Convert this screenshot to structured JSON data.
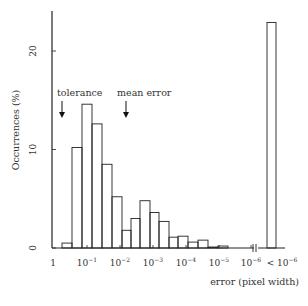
{
  "chart_data": {
    "type": "bar",
    "title": "",
    "xlabel": "error (pixel width)",
    "ylabel": "Occurrences (%)",
    "ylim": [
      0,
      24
    ],
    "yticks": [
      0,
      10,
      20
    ],
    "xtick_labels": [
      "1",
      "10^-1",
      "10^-2",
      "10^-3",
      "10^-4",
      "10^-5",
      "10^-6",
      "< 10^-6"
    ],
    "grid": false,
    "legend": null,
    "annotations": [
      {
        "text": "tolerance",
        "arrow": "down",
        "x_pos": "between 1 and 10^-1 (~10^-0.5)"
      },
      {
        "text": "mean error",
        "arrow": "down",
        "x_pos": "~10^-2.1"
      }
    ],
    "bins": [
      {
        "from": "10^0",
        "to": "10^-0.33",
        "value": 0.5
      },
      {
        "from": "10^-0.33",
        "to": "10^-0.67",
        "value": 10.2
      },
      {
        "from": "10^-0.67",
        "to": "10^-1",
        "value": 14.6
      },
      {
        "from": "10^-1",
        "to": "10^-1.33",
        "value": 12.6
      },
      {
        "from": "10^-1.33",
        "to": "10^-1.67",
        "value": 8.5
      },
      {
        "from": "10^-1.67",
        "to": "10^-2",
        "value": 5.2
      },
      {
        "from": "10^-2",
        "to": "10^-2.33",
        "value": 1.8
      },
      {
        "from": "10^-2.33",
        "to": "10^-2.67",
        "value": 3.0
      },
      {
        "from": "10^-2.67",
        "to": "10^-3",
        "value": 4.8
      },
      {
        "from": "10^-3",
        "to": "10^-3.33",
        "value": 3.6
      },
      {
        "from": "10^-3.33",
        "to": "10^-3.67",
        "value": 2.7
      },
      {
        "from": "10^-3.67",
        "to": "10^-4",
        "value": 1.1
      },
      {
        "from": "10^-4",
        "to": "10^-4.33",
        "value": 1.2
      },
      {
        "from": "10^-4.33",
        "to": "10^-4.67",
        "value": 0.6
      },
      {
        "from": "10^-4.67",
        "to": "10^-5",
        "value": 0.8
      },
      {
        "from": "10^-5",
        "to": "10^-5.33",
        "value": 0.1
      },
      {
        "from": "10^-5.33",
        "to": "10^-5.67",
        "value": 0.2
      },
      {
        "from": "10^-5.67",
        "to": "10^-6",
        "value": 0.0
      },
      {
        "from": "< 10^-6",
        "to": "< 10^-6",
        "value": 22.9
      }
    ],
    "values": [
      0.5,
      10.2,
      14.6,
      12.6,
      8.5,
      5.2,
      1.8,
      3.0,
      4.8,
      3.6,
      2.7,
      1.1,
      1.2,
      0.6,
      0.8,
      0.1,
      0.2,
      0.0,
      22.9
    ]
  },
  "axis": {
    "ylabel": "Occurrences (%)",
    "xlabel": "error (pixel width)",
    "yticks": [
      {
        "label": "0",
        "value": 0
      },
      {
        "label": "10",
        "value": 10
      },
      {
        "label": "20",
        "value": 20
      }
    ],
    "xticks": [
      {
        "base": "1",
        "exp": "",
        "prefix": ""
      },
      {
        "base": "10",
        "exp": "−1",
        "prefix": ""
      },
      {
        "base": "10",
        "exp": "−2",
        "prefix": ""
      },
      {
        "base": "10",
        "exp": "−3",
        "prefix": ""
      },
      {
        "base": "10",
        "exp": "−4",
        "prefix": ""
      },
      {
        "base": "10",
        "exp": "−5",
        "prefix": ""
      },
      {
        "base": "10",
        "exp": "−6",
        "prefix": ""
      },
      {
        "base": "10",
        "exp": "−6",
        "prefix": "< "
      }
    ]
  },
  "annotations": {
    "tolerance": "tolerance",
    "mean_error": "mean error"
  }
}
